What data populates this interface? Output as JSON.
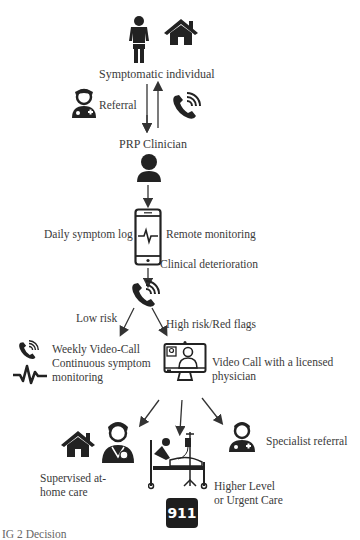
{
  "diagram": {
    "nodes": {
      "individual": {
        "label": "Symptomatic individual",
        "icons": [
          "person-icon",
          "house-icon"
        ]
      },
      "referral": {
        "label": "Referral"
      },
      "clinician": {
        "label": "PRP Clinician"
      },
      "daily_log": {
        "label": "Daily symptom log"
      },
      "remote": {
        "label": "Remote monitoring"
      },
      "deterioration": {
        "label": "Clinical deterioration"
      },
      "low_risk": {
        "label": "Low risk"
      },
      "high_risk": {
        "label": "High risk/Red flags"
      },
      "weekly": {
        "line1": "Weekly Video-Call",
        "line2": "Continuous symptom",
        "line3": "monitoring"
      },
      "videocall": {
        "line1": "Video Call with a licensed",
        "line2": "physician"
      },
      "home_care": {
        "line1": "Supervised at-",
        "line2": "home care"
      },
      "higher_level": {
        "line1": "Higher Level",
        "line2": "or Urgent Care"
      },
      "specialist": {
        "label": "Specialist referral"
      },
      "emergency": {
        "label": "911"
      }
    },
    "caption": "IG 2 Decision"
  }
}
